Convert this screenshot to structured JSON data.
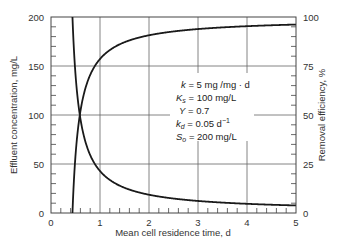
{
  "chart_data": {
    "type": "line",
    "title": "",
    "xlabel": "Mean cell residence time, d",
    "ylabel": "Effluent concentration, mg/L",
    "ylabel_right": "Removal efficiency, %",
    "xlim": [
      0,
      5
    ],
    "ylim": [
      0,
      200
    ],
    "ylim_right": [
      0,
      100
    ],
    "x_ticks": [
      "0",
      "1",
      "2",
      "3",
      "4",
      "5"
    ],
    "y_ticks": [
      "0",
      "50",
      "100",
      "150",
      "200"
    ],
    "y_ticks_right": [
      "0",
      "25",
      "50",
      "75",
      "100"
    ],
    "grid": true,
    "series": [
      {
        "name": "Effluent concentration, mg/L",
        "axis": "left",
        "x": [
          0.44,
          0.45,
          0.5,
          0.55,
          0.588,
          0.65,
          0.75,
          0.9,
          1.0,
          1.25,
          1.5,
          2.0,
          2.5,
          3.0,
          3.5,
          4.0,
          4.5,
          5.0
        ],
        "values": [
          200,
          187,
          151,
          113,
          100,
          82,
          62,
          48,
          42.9,
          32.4,
          26.4,
          18.6,
          14.6,
          12.0,
          10.2,
          8.9,
          8.3,
          7.7
        ]
      },
      {
        "name": "Removal efficiency, %",
        "axis": "right",
        "x": [
          0.438,
          0.45,
          0.5,
          0.55,
          0.588,
          0.65,
          0.75,
          0.9,
          1.0,
          1.25,
          1.5,
          2.0,
          2.5,
          3.0,
          3.5,
          4.0,
          4.5,
          5.0
        ],
        "values": [
          0,
          6.5,
          24.5,
          43.5,
          50,
          59,
          69,
          76,
          78.6,
          83.8,
          86.8,
          90.7,
          92.7,
          94.0,
          94.9,
          95.5,
          95.9,
          96.2
        ]
      }
    ],
    "annotations": [
      "k = 5 mg/mg·d",
      "Ks = 100 mg/L",
      "Y = 0.7",
      "kd = 0.05 d^-1",
      "So = 200 mg/L"
    ]
  },
  "labels": {
    "xlabel": "Mean cell residence time, d",
    "ylabel": "Effluent concentration, mg/L",
    "ylabel_right": "Removal efficiency, %",
    "x_ticks": [
      "0",
      "1",
      "2",
      "3",
      "4",
      "5"
    ],
    "y_ticks": [
      "0",
      "50",
      "100",
      "150",
      "200"
    ],
    "y_ticks_right": [
      "0",
      "25",
      "50",
      "75",
      "100"
    ],
    "params": {
      "k_sym": "k",
      "k_val": " = 5 mg /mg · d",
      "ks_sym": "K",
      "ks_sub": "s",
      "ks_val": " = 100 mg/L",
      "y_sym": "Y",
      "y_val": " = 0.7",
      "kd_sym": "k",
      "kd_sub": "d",
      "kd_val": " = 0.05 d",
      "kd_sup": "−1",
      "so_sym": "S",
      "so_sub": "o",
      "so_val": " = 200 mg/L"
    }
  }
}
